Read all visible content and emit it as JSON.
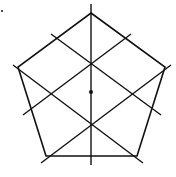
{
  "diagram": {
    "stroke_color": "#111111",
    "background": "#ffffff",
    "center": [
      91,
      92
    ],
    "vertices": [
      [
        91,
        13
      ],
      [
        165,
        67
      ],
      [
        137,
        156
      ],
      [
        46,
        156
      ],
      [
        18,
        67
      ]
    ],
    "symmetry_lines": [
      {
        "from": [
          91,
          4
        ],
        "to": [
          91,
          165
        ]
      },
      {
        "from": [
          171,
          65
        ],
        "to": [
          41,
          163
        ]
      },
      {
        "from": [
          143,
          163
        ],
        "to": [
          13,
          65
        ]
      },
      {
        "from": [
          51,
          34
        ],
        "to": [
          161,
          115
        ]
      },
      {
        "from": [
          131,
          34
        ],
        "to": [
          23,
          115
        ]
      }
    ],
    "dot": [
      2,
      11
    ]
  }
}
